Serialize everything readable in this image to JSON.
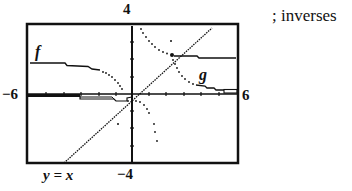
{
  "figure": {
    "caption": "; inverses",
    "window": {
      "xmin_label": "−6",
      "xmax_label": "6",
      "ymax_label": "4",
      "ymin_label": "−4",
      "xmin": -6,
      "xmax": 6,
      "ymin": -4,
      "ymax": 4
    },
    "curve_labels": {
      "f": "f",
      "g": "g",
      "identity": "y = x"
    }
  }
}
